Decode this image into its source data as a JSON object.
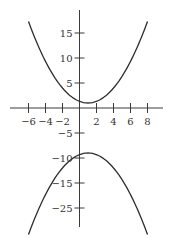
{
  "chart_data": {
    "type": "line",
    "title": "",
    "xlabel": "",
    "ylabel": "",
    "grid": false,
    "legend": null,
    "xlim": [
      -8,
      10
    ],
    "ylim": [
      -25.5,
      19.5
    ],
    "x_ticks": [
      -6,
      -4,
      -2,
      2,
      4,
      6,
      8
    ],
    "x_tick_labels": [
      "−6",
      "−4",
      "−2",
      "2",
      "4",
      "6",
      "8"
    ],
    "y_ticks": [
      15,
      10,
      5,
      -5,
      -10,
      -15,
      -20
    ],
    "y_tick_labels": [
      "15",
      "10",
      "5",
      "−5",
      "−10",
      "−15",
      "−25"
    ],
    "series": [
      {
        "name": "upper parabola",
        "equation_estimate": "y = (x - 1)^2 / 3 + 1",
        "vertex": [
          1,
          1
        ],
        "x": [
          -6,
          -4,
          -2,
          0,
          1,
          2,
          4,
          6,
          8
        ],
        "y": [
          17.3,
          9.3,
          4.0,
          1.3,
          1.0,
          1.3,
          4.0,
          9.3,
          17.3
        ]
      },
      {
        "name": "lower parabola",
        "equation_estimate": "y = -(x - 1)^2 / 3 - 9",
        "vertex": [
          1,
          -9
        ],
        "x": [
          -6,
          -4,
          -2,
          0,
          1,
          2,
          4,
          6,
          8
        ],
        "y": [
          -25.3,
          -17.3,
          -12.0,
          -9.3,
          -9.0,
          -9.3,
          -12.0,
          -17.3,
          -25.3
        ]
      }
    ],
    "annotations": []
  },
  "colors": {
    "axis": "#3a3a3a",
    "curve": "#2e2e2e",
    "text": "#333333",
    "background": "#ffffff"
  }
}
